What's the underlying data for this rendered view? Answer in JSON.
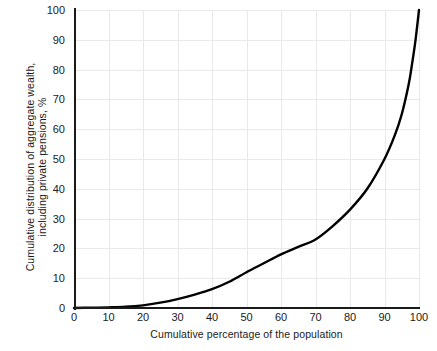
{
  "chart_data": {
    "type": "line",
    "title": "",
    "subtitle": "",
    "xlabel": "Cumulative percentage of the population",
    "ylabel": "Cumulative distribution of aggregate wealth, including private pensions, %",
    "ylabel_lines": [
      "Cumulative distribution of aggregate wealth,",
      "including private pensions, %"
    ],
    "xlim": [
      0,
      100
    ],
    "ylim": [
      0,
      100
    ],
    "xticks": [
      0,
      10,
      20,
      30,
      40,
      50,
      60,
      70,
      80,
      90,
      100
    ],
    "yticks": [
      0,
      10,
      20,
      30,
      40,
      50,
      60,
      70,
      80,
      90,
      100
    ],
    "grid": true,
    "legend": null,
    "series": [
      {
        "name": "Cumulative distribution of aggregate wealth, including private pensions",
        "color": "#000000",
        "x": [
          0,
          5,
          10,
          15,
          20,
          25,
          30,
          35,
          40,
          45,
          50,
          55,
          60,
          65,
          70,
          75,
          80,
          85,
          90,
          93,
          95,
          97,
          98,
          99,
          100
        ],
        "values": [
          0,
          0.1,
          0.2,
          0.4,
          0.9,
          1.8,
          3.0,
          4.5,
          6.3,
          8.8,
          12.0,
          15.0,
          18.0,
          20.5,
          23.0,
          27.5,
          33.0,
          40.0,
          50.0,
          58.0,
          65.0,
          75.0,
          82.0,
          90.0,
          100.0
        ]
      }
    ],
    "annotations": []
  },
  "axis": {
    "x_tick_labels": [
      "0",
      "10",
      "20",
      "30",
      "40",
      "50",
      "60",
      "70",
      "80",
      "90",
      "100"
    ],
    "y_tick_labels": [
      "0",
      "10",
      "20",
      "30",
      "40",
      "50",
      "60",
      "70",
      "80",
      "90",
      "100"
    ]
  },
  "colors": {
    "curve": "#000000",
    "grid": "#e9e9ec",
    "axis": "#1a1a1a",
    "background": "#ffffff",
    "text": "#1a1a1a"
  }
}
